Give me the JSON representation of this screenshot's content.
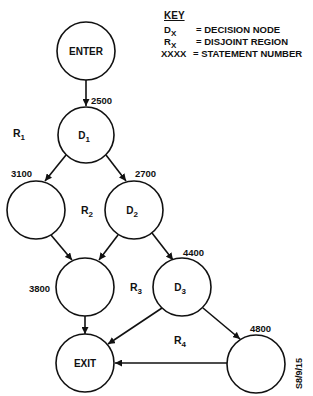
{
  "key": {
    "title": "KEY",
    "entries": [
      {
        "symbol": "D",
        "subscript": "X",
        "description": "= DECISION NODE"
      },
      {
        "symbol": "R",
        "subscript": "X",
        "description": "= DISJOINT REGION"
      },
      {
        "symbol": "XXXX",
        "subscript": "",
        "description": "= STATEMENT NUMBER"
      }
    ]
  },
  "nodes": {
    "enter": {
      "label": "ENTER",
      "statement": ""
    },
    "d1": {
      "label": "D",
      "subscript": "1",
      "statement": "2500"
    },
    "n3100": {
      "label": "",
      "statement": "3100"
    },
    "d2": {
      "label": "D",
      "subscript": "2",
      "statement": "2700"
    },
    "n3800": {
      "label": "",
      "statement": "3800"
    },
    "d3": {
      "label": "D",
      "subscript": "3",
      "statement": "4400"
    },
    "n4800": {
      "label": "",
      "statement": "4800"
    },
    "exit": {
      "label": "EXIT",
      "statement": ""
    }
  },
  "regions": [
    {
      "label": "R",
      "subscript": "1"
    },
    {
      "label": "R",
      "subscript": "2"
    },
    {
      "label": "R",
      "subscript": "3"
    },
    {
      "label": "R",
      "subscript": "4"
    }
  ],
  "edges": [
    {
      "from": "ENTER",
      "to": "D1"
    },
    {
      "from": "D1",
      "to": "3100"
    },
    {
      "from": "D1",
      "to": "D2"
    },
    {
      "from": "3100",
      "to": "3800"
    },
    {
      "from": "D2",
      "to": "3800"
    },
    {
      "from": "D2",
      "to": "D3"
    },
    {
      "from": "3800",
      "to": "EXIT"
    },
    {
      "from": "D3",
      "to": "EXIT"
    },
    {
      "from": "D3",
      "to": "4800"
    },
    {
      "from": "4800",
      "to": "EXIT"
    }
  ],
  "figure_id": "S8/9/15"
}
